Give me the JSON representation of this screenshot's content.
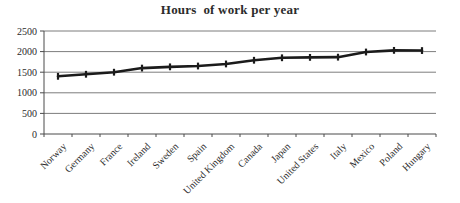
{
  "figure": {
    "background_color": "#ffffff"
  },
  "chart_data": {
    "type": "line",
    "title": "Hours  of work per year",
    "categories": [
      "Norway",
      "Germany",
      "France",
      "Ireland",
      "Sweden",
      "Spain",
      "United Kingdom",
      "Canada",
      "Japan",
      "United States",
      "Italy",
      "Mexico",
      "Poland",
      "Hungary"
    ],
    "values": [
      1400,
      1450,
      1500,
      1600,
      1630,
      1650,
      1700,
      1790,
      1850,
      1860,
      1865,
      1990,
      2030,
      2025
    ],
    "xlabel": "",
    "ylabel": "",
    "ylim": [
      0,
      2500
    ],
    "yticks": [
      0,
      500,
      1000,
      1500,
      2000,
      2500
    ],
    "grid": "horizontal",
    "legend": "none",
    "marker": "vertical-dash",
    "line_color": "#1b1b1b",
    "grid_color": "#7d7d7d",
    "axis_color": "#4a4a4a",
    "text_color": "#2b2b2b"
  }
}
